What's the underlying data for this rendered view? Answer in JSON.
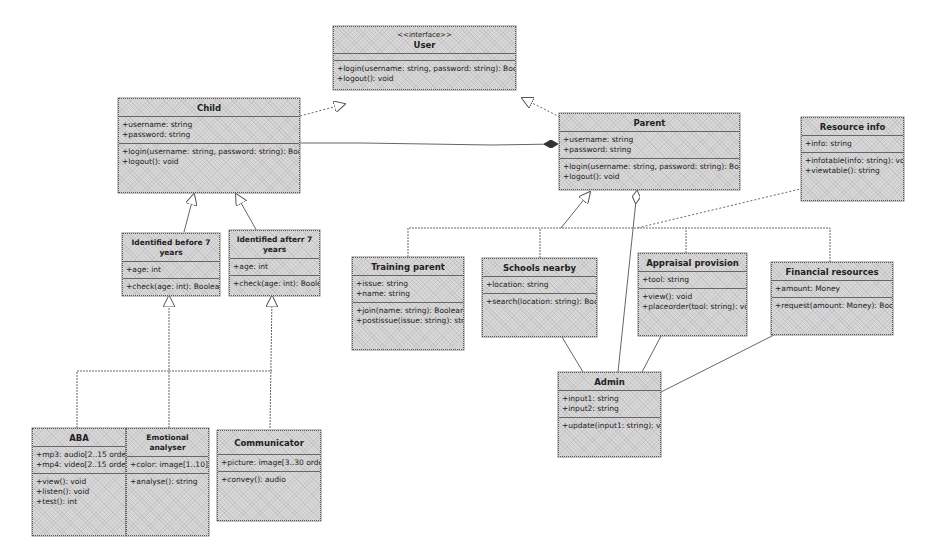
{
  "diagram": {
    "type": "UML class diagram",
    "classes": {
      "user": {
        "stereotype": "<<interface>>",
        "name": "User",
        "attributes": [],
        "operations": [
          "+login(username: string, password: string): Boolean",
          "+logout(): void"
        ]
      },
      "child": {
        "name": "Child",
        "attributes": [
          "+username: string",
          "+password: string"
        ],
        "operations": [
          "+login(username: string, password: string): Boolean",
          "+logout(): void"
        ]
      },
      "parent": {
        "name": "Parent",
        "attributes": [
          "+username: string",
          "+password: string"
        ],
        "operations": [
          "+login(username: string, password: string): Boolean",
          "+logout(): void"
        ]
      },
      "resource_info": {
        "name": "Resource info",
        "attributes": [
          "+info: string"
        ],
        "operations": [
          "+infotable(info: string): void",
          "+viewtable(): string"
        ]
      },
      "identified_before": {
        "name": "Identified before 7 years",
        "attributes": [
          "+age: int"
        ],
        "operations": [
          "+check(age: int): Boolean"
        ]
      },
      "identified_after": {
        "name": "Identified afterr 7 years",
        "attributes": [
          "+age: int"
        ],
        "operations": [
          "+check(age: int): Boolean"
        ]
      },
      "training_parent": {
        "name": "Training parent",
        "attributes": [
          "+issue: string",
          "+name: string"
        ],
        "operations": [
          "+join(name: string): Boolean",
          "+postissue(issue: string): string"
        ]
      },
      "schools_nearby": {
        "name": "Schools nearby",
        "attributes": [
          "+location: string"
        ],
        "operations": [
          "+search(location: string): Boolean"
        ]
      },
      "appraisal_provision": {
        "name": "Appraisal provision",
        "attributes": [
          "+tool: string"
        ],
        "operations": [
          "+view(): void",
          "+placeorder(tool: string): void"
        ]
      },
      "financial_resources": {
        "name": "Financial resources",
        "attributes": [
          "+amount: Money"
        ],
        "operations": [
          "+request(amount: Money): Boolean"
        ]
      },
      "admin": {
        "name": "Admin",
        "attributes": [
          "+input1: string",
          "+input2: string"
        ],
        "operations": [
          "+update(input1: string): void"
        ]
      },
      "aba": {
        "name": "ABA",
        "attributes": [
          "+mp3: audio[2..15 ordered]",
          "+mp4: video[2..15 ordered]"
        ],
        "operations": [
          "+view(): void",
          "+listen(): void",
          "+test(): int"
        ]
      },
      "emotional_analyser": {
        "name": "Emotional analyser",
        "attributes": [
          "+color: image[1..10]"
        ],
        "operations": [
          "+analyse(): string"
        ]
      },
      "communicator": {
        "name": "Communicator",
        "attributes": [
          "+picture: image[3..30 ordered]"
        ],
        "operations": [
          "+convey(): audio"
        ]
      }
    },
    "relationships": [
      {
        "from": "Child",
        "to": "User",
        "kind": "realization"
      },
      {
        "from": "Parent",
        "to": "User",
        "kind": "realization"
      },
      {
        "from": "Child",
        "to": "Parent",
        "kind": "composition"
      },
      {
        "from": "Identified before 7 years",
        "to": "Child",
        "kind": "generalization"
      },
      {
        "from": "Identified afterr 7 years",
        "to": "Child",
        "kind": "generalization"
      },
      {
        "from": "ABA",
        "to": "Identified before 7 years",
        "kind": "generalization"
      },
      {
        "from": "Emotional analyser",
        "to": "Identified before 7 years",
        "kind": "generalization"
      },
      {
        "from": "Communicator",
        "to": "Identified afterr 7 years",
        "kind": "generalization"
      },
      {
        "from": "Training parent",
        "to": "Parent",
        "kind": "generalization"
      },
      {
        "from": "Schools nearby",
        "to": "Parent",
        "kind": "generalization"
      },
      {
        "from": "Appraisal provision",
        "to": "Parent",
        "kind": "generalization"
      },
      {
        "from": "Financial resources",
        "to": "Parent",
        "kind": "generalization"
      },
      {
        "from": "Admin",
        "to": "Parent",
        "kind": "aggregation"
      },
      {
        "from": "Resource info",
        "to": "Parent",
        "kind": "dependency"
      },
      {
        "from": "Admin",
        "to": "Schools nearby",
        "kind": "association"
      },
      {
        "from": "Admin",
        "to": "Appraisal provision",
        "kind": "association"
      },
      {
        "from": "Admin",
        "to": "Financial resources",
        "kind": "association"
      }
    ]
  }
}
